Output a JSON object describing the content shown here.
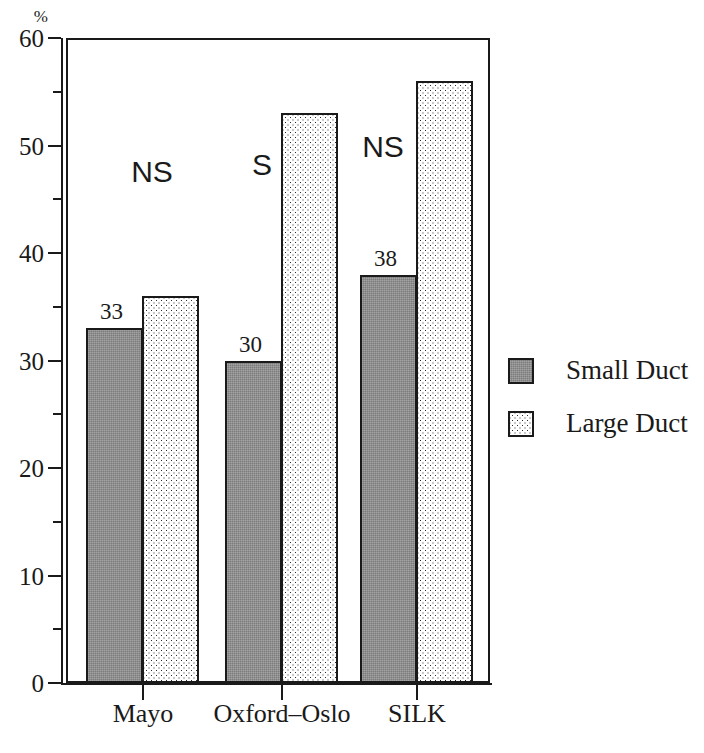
{
  "chart_data": {
    "type": "bar",
    "title": "",
    "subtitle": "",
    "xlabel": "",
    "ylabel": "%",
    "unit_label": "%",
    "categories": [
      "Mayo",
      "Oxford–Oslo",
      "SILK"
    ],
    "series": [
      {
        "name": "Small Duct",
        "values": [
          33,
          30,
          38
        ],
        "fill": "solid-gray",
        "color": "#8c8c8c"
      },
      {
        "name": "Large Duct",
        "values": [
          36,
          53,
          56
        ],
        "fill": "dotted",
        "color": "#ffffff"
      }
    ],
    "value_labels": [
      "33",
      "30",
      "38"
    ],
    "annotations": [
      {
        "category": "Mayo",
        "text": "NS"
      },
      {
        "category": "Oxford–Oslo",
        "text": "S"
      },
      {
        "category": "SILK",
        "text": "NS"
      }
    ],
    "ylim": [
      0,
      60
    ],
    "ytick_labels": [
      "0",
      "10",
      "20",
      "30",
      "40",
      "50",
      "60"
    ],
    "ytick_values": [
      0,
      10,
      20,
      30,
      40,
      50,
      60
    ],
    "yminor_values": [
      5,
      15,
      25,
      35,
      45,
      55
    ],
    "grid": false,
    "legend_position": "right",
    "legend_entries": [
      "Small Duct",
      "Large Duct"
    ],
    "axis_color": "#1a1a1a",
    "background": "#ffffff"
  },
  "axis": {
    "unit": "%",
    "ticks": [
      {
        "label": "60",
        "value": 60
      },
      {
        "label": "50",
        "value": 50
      },
      {
        "label": "40",
        "value": 40
      },
      {
        "label": "30",
        "value": 30
      },
      {
        "label": "20",
        "value": 20
      },
      {
        "label": "10",
        "value": 10
      },
      {
        "label": "0",
        "value": 0
      }
    ]
  },
  "groups": [
    {
      "label": "Mayo",
      "significance": "NS",
      "small": {
        "value": 33,
        "label": "33"
      },
      "large": {
        "value": 36,
        "label": ""
      }
    },
    {
      "label": "Oxford–Oslo",
      "significance": "S",
      "small": {
        "value": 30,
        "label": "30"
      },
      "large": {
        "value": 53,
        "label": ""
      }
    },
    {
      "label": "SILK",
      "significance": "NS",
      "small": {
        "value": 38,
        "label": "38"
      },
      "large": {
        "value": 56,
        "label": ""
      }
    }
  ],
  "legend": {
    "items": [
      {
        "label": "Small Duct",
        "swatch": "solid-gray-swatch"
      },
      {
        "label": "Large Duct",
        "swatch": "dotted-swatch"
      }
    ]
  }
}
